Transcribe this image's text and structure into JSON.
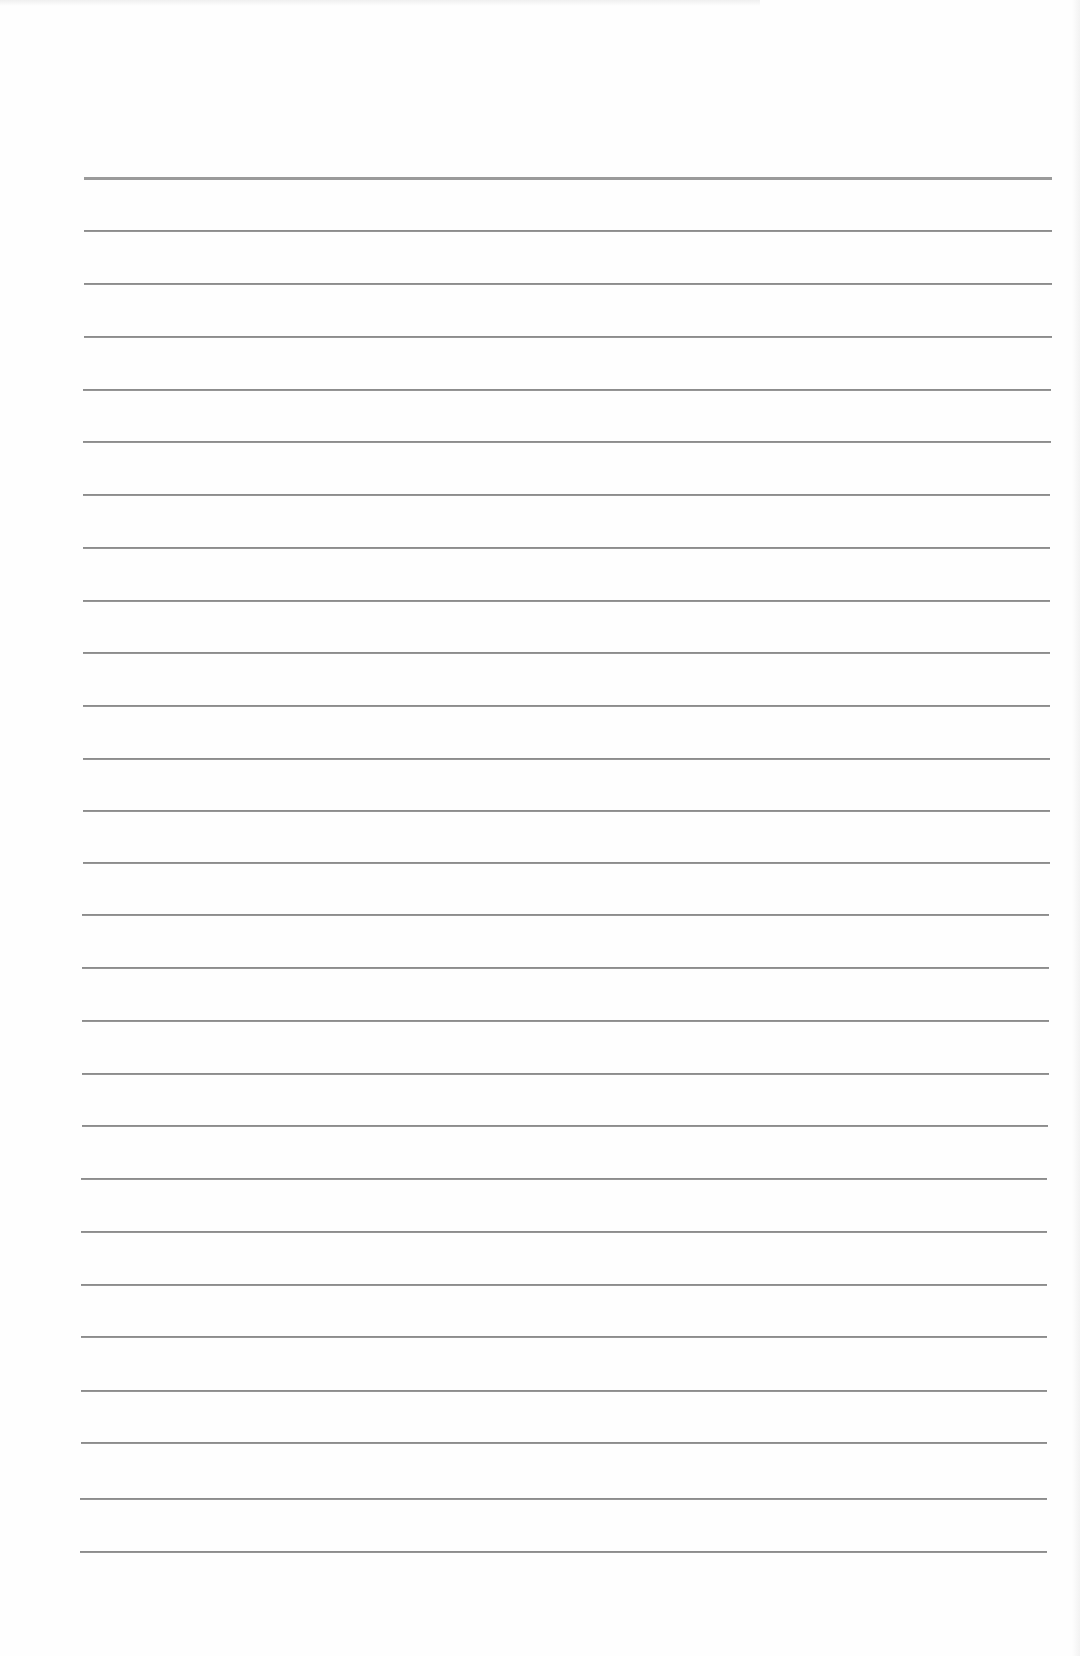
{
  "document": {
    "type": "lined-paper",
    "text": "",
    "header_line": {
      "y": 177,
      "x": 84,
      "width": 968,
      "thickness": 3,
      "color": "#9a9a9a"
    },
    "rule_color": "#8c8c8c",
    "rules": [
      {
        "y": 230,
        "x": 84,
        "width": 968
      },
      {
        "y": 283,
        "x": 84,
        "width": 968
      },
      {
        "y": 336,
        "x": 84,
        "width": 968
      },
      {
        "y": 389,
        "x": 83,
        "width": 968
      },
      {
        "y": 441,
        "x": 83,
        "width": 968
      },
      {
        "y": 494,
        "x": 83,
        "width": 967
      },
      {
        "y": 547,
        "x": 83,
        "width": 967
      },
      {
        "y": 600,
        "x": 83,
        "width": 967
      },
      {
        "y": 652,
        "x": 83,
        "width": 967
      },
      {
        "y": 705,
        "x": 83,
        "width": 967
      },
      {
        "y": 758,
        "x": 83,
        "width": 967
      },
      {
        "y": 810,
        "x": 83,
        "width": 967
      },
      {
        "y": 862,
        "x": 83,
        "width": 967
      },
      {
        "y": 914,
        "x": 82,
        "width": 967
      },
      {
        "y": 967,
        "x": 82,
        "width": 967
      },
      {
        "y": 1020,
        "x": 82,
        "width": 967
      },
      {
        "y": 1073,
        "x": 82,
        "width": 967
      },
      {
        "y": 1125,
        "x": 82,
        "width": 966
      },
      {
        "y": 1178,
        "x": 81,
        "width": 966
      },
      {
        "y": 1231,
        "x": 81,
        "width": 966
      },
      {
        "y": 1284,
        "x": 81,
        "width": 966
      },
      {
        "y": 1336,
        "x": 81,
        "width": 966
      },
      {
        "y": 1390,
        "x": 81,
        "width": 966
      },
      {
        "y": 1442,
        "x": 81,
        "width": 966
      },
      {
        "y": 1498,
        "x": 80,
        "width": 967
      },
      {
        "y": 1551,
        "x": 80,
        "width": 967
      }
    ]
  }
}
